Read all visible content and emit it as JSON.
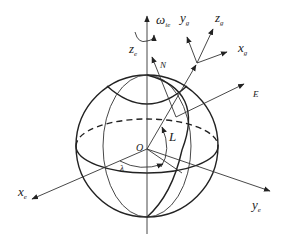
{
  "diagram": {
    "type": "earth-coordinate-frames",
    "labels": {
      "omega": "ω",
      "omega_sub": "ie",
      "z_e": "z",
      "z_e_sub": "e",
      "x_e": "x",
      "x_e_sub": "e",
      "y_e": "y",
      "y_e_sub": "e",
      "origin": "O",
      "latitude": "L",
      "longitude": "λ",
      "north": "N",
      "east": "E",
      "x_g": "x",
      "x_g_sub": "g",
      "y_g": "y",
      "y_g_sub": "g",
      "z_g": "z",
      "z_g_sub": "g"
    },
    "colors": {
      "stroke": "#222222",
      "background": "#ffffff"
    }
  }
}
